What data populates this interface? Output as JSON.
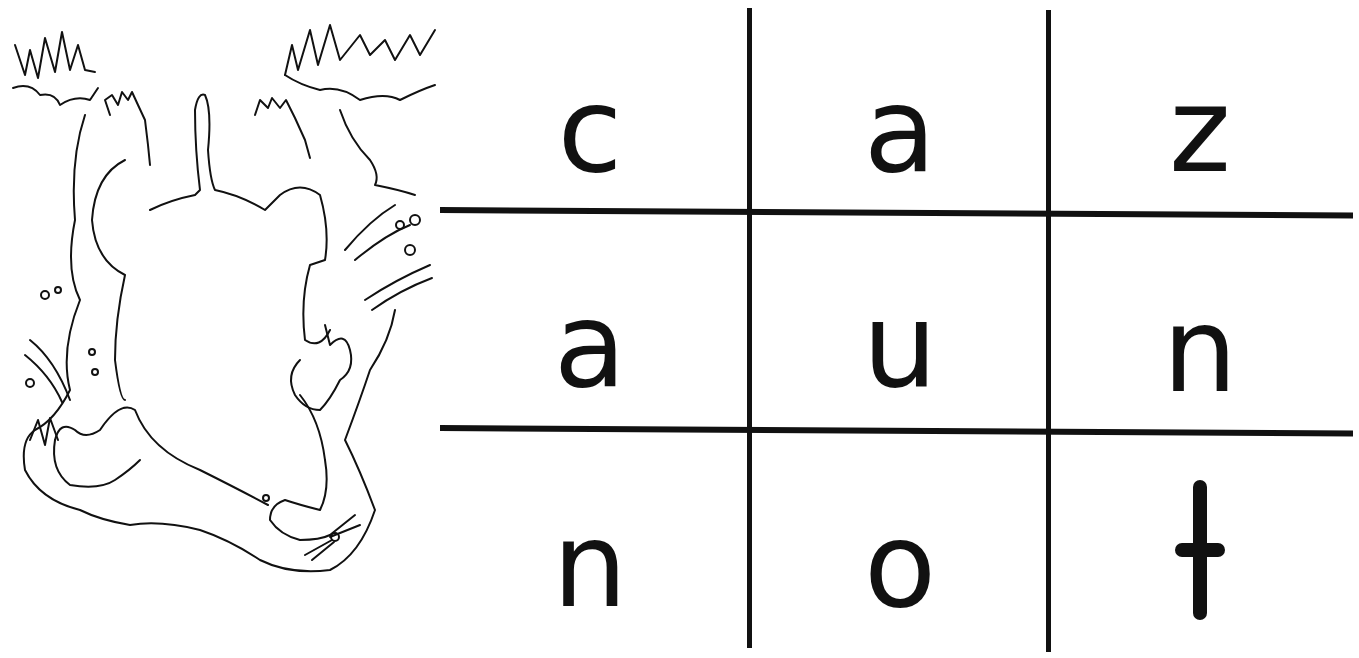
{
  "worksheet": {
    "illustration": {
      "subject": "mole digging underground",
      "icon": "mole-illustration"
    },
    "letter_grid": {
      "rows": 3,
      "cols": 3,
      "cells": [
        [
          "c",
          "a",
          "z"
        ],
        [
          "a",
          "u",
          "n"
        ],
        [
          "n",
          "o",
          "t"
        ]
      ]
    },
    "colors": {
      "ink": "#111111",
      "background": "#ffffff"
    }
  }
}
